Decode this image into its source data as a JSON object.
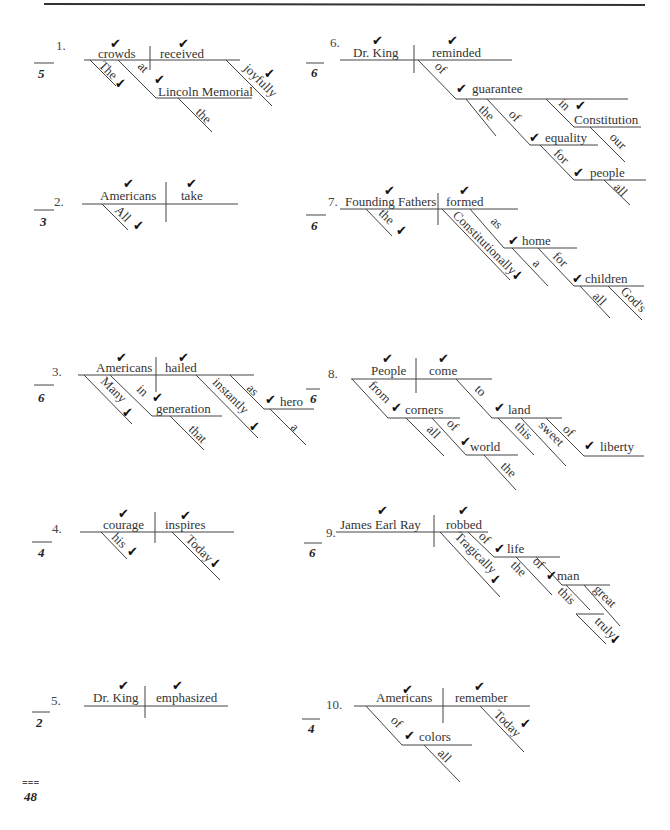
{
  "page": {
    "total_score": "48",
    "total_marker": "==="
  },
  "check_mark": "✔",
  "problems": [
    {
      "number": "1.",
      "score": "5",
      "subject": "crowds",
      "verb": "received",
      "modifiers": {
        "the": "The",
        "at": "at",
        "object": "Lincoln Memorial",
        "the2": "the",
        "joyfully": "joyfully"
      }
    },
    {
      "number": "2.",
      "score": "3",
      "subject": "Americans",
      "verb": "take",
      "modifiers": {
        "all": "All"
      }
    },
    {
      "number": "3.",
      "score": "6",
      "extra_score": "6",
      "subject": "Americans",
      "verb": "hailed",
      "modifiers": {
        "many": "Many",
        "in": "in",
        "generation": "generation",
        "that": "that",
        "instantly": "instantly",
        "as": "as",
        "hero": "hero",
        "a": "a"
      }
    },
    {
      "number": "4.",
      "score": "4",
      "subject": "courage",
      "verb": "inspires",
      "modifiers": {
        "his": "his",
        "today": "Today"
      }
    },
    {
      "number": "5.",
      "score": "2",
      "subject": "Dr. King",
      "verb": "emphasized",
      "modifiers": {}
    },
    {
      "number": "6.",
      "score": "6",
      "subject": "Dr. King",
      "verb": "reminded",
      "modifiers": {
        "of": "of",
        "guarantee": "guarantee",
        "the": "the",
        "of2": "of",
        "equality": "equality",
        "in": "in",
        "constitution": "Constitution",
        "our": "our",
        "for": "for",
        "people": "people",
        "all": "all"
      }
    },
    {
      "number": "7.",
      "score": "6",
      "subject": "Founding Fathers",
      "verb": "formed",
      "modifiers": {
        "the": "the",
        "constitutionally": "Constitutionally",
        "as": "as",
        "home": "home",
        "a": "a",
        "for": "for",
        "children": "children",
        "all": "all",
        "gods": "God's"
      }
    },
    {
      "number": "8.",
      "score": "",
      "subject": "People",
      "verb": "come",
      "modifiers": {
        "from": "from",
        "corners": "corners",
        "all": "all",
        "of": "of",
        "world": "world",
        "the": "the",
        "to": "to",
        "land": "land",
        "this": "this",
        "sweet": "sweet",
        "of2": "of",
        "liberty": "liberty"
      }
    },
    {
      "number": "9.",
      "score": "6",
      "subject": "James Earl Ray",
      "verb": "robbed",
      "modifiers": {
        "tragically": "Tragically",
        "of": "of",
        "life": "life",
        "the": "the",
        "of2": "of",
        "man": "man",
        "this": "this",
        "great": "great",
        "truly": "truly"
      }
    },
    {
      "number": "10.",
      "score": "4",
      "subject": "Americans",
      "verb": "remember",
      "modifiers": {
        "of": "of",
        "colors": "colors",
        "all": "all",
        "today": "Today"
      }
    }
  ]
}
